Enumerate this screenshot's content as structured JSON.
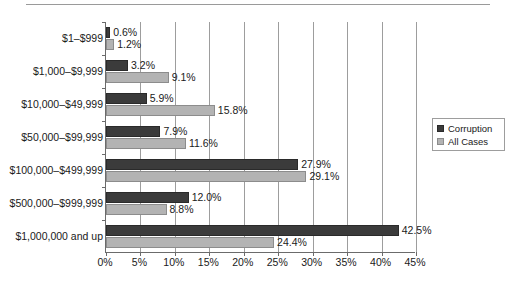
{
  "chart_data": {
    "type": "bar",
    "orientation": "horizontal",
    "title": "",
    "xlabel": "",
    "ylabel": "",
    "xlim": [
      0,
      45
    ],
    "xtick_step": 5,
    "grid": "vertical",
    "legend_position": "right",
    "categories": [
      "$1–$999",
      "$1,000–$9,999",
      "$10,000–$49,999",
      "$50,000–$99,999",
      "$100,000–$499,999",
      "$500,000–$999,999",
      "$1,000,000 and up"
    ],
    "xtick_labels": [
      "0%",
      "5%",
      "10%",
      "15%",
      "20%",
      "25%",
      "30%",
      "35%",
      "40%",
      "45%"
    ],
    "xtick_values": [
      0,
      5,
      10,
      15,
      20,
      25,
      30,
      35,
      40,
      45
    ],
    "series": [
      {
        "name": "Corruption",
        "color": "#3b3b3b",
        "values": [
          0.6,
          3.2,
          5.9,
          7.9,
          27.9,
          12.0,
          42.5
        ],
        "labels": [
          "0.6%",
          "3.2%",
          "5.9%",
          "7.9%",
          "27.9%",
          "12.0%",
          "42.5%"
        ]
      },
      {
        "name": "All Cases",
        "color": "#b3b3b3",
        "values": [
          1.2,
          9.1,
          15.8,
          11.6,
          29.1,
          8.8,
          24.4
        ],
        "labels": [
          "1.2%",
          "9.1%",
          "15.8%",
          "11.6%",
          "29.1%",
          "8.8%",
          "24.4%"
        ]
      }
    ]
  },
  "legend": {
    "items": [
      {
        "label": "Corruption",
        "swatch": "corruption"
      },
      {
        "label": "All Cases",
        "swatch": "allcases"
      }
    ]
  }
}
